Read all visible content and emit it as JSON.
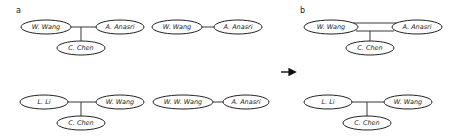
{
  "panels": {
    "a": {
      "label": "a"
    },
    "b": {
      "label": "b"
    }
  },
  "nodes": {
    "a_top_left": {
      "n1": "W. Wang",
      "n2": "A. Anasri",
      "n3": "C. Chen"
    },
    "a_top_mid": {
      "n1": "W. Wang",
      "n2": "A. Anasri"
    },
    "a_bot_left": {
      "n1": "L. Li",
      "n2": "W. Wang",
      "n3": "C. Chen"
    },
    "a_bot_mid": {
      "n1": "W. W. Wang",
      "n2": "A. Anasri"
    },
    "b_top": {
      "n1": "W. Wang",
      "n2": "A. Anasri",
      "n3": "C. Chen"
    },
    "b_bot": {
      "n1": "L. Li",
      "n2": "W. Wang",
      "n3": "C. Chen"
    }
  },
  "arrow": {
    "icon": "right-arrow-icon"
  }
}
